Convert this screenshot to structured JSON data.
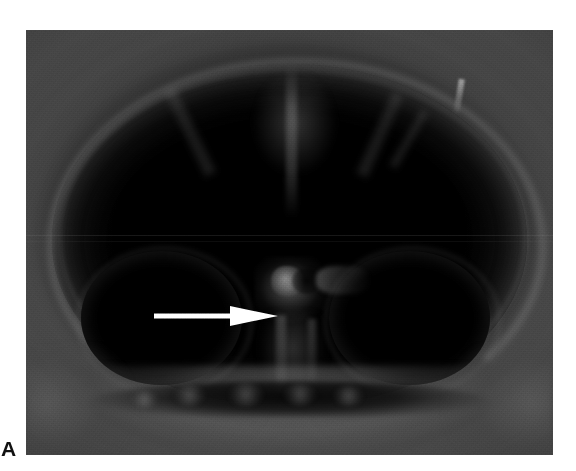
{
  "figure": {
    "panel_label": "A",
    "modality": "axial CT scan of the head",
    "image_type": "grayscale radiographic film photograph",
    "background_color": "#ffffff",
    "film_background_color": "#3c3c3c",
    "annotation_color": "#ffffff",
    "label_color": "#111111"
  },
  "plate": {
    "name": "axial-ct-head-image",
    "left": 26,
    "top": 30,
    "width": 527,
    "height": 425
  },
  "annotations": [
    {
      "type": "arrow",
      "direction": "right",
      "color": "#ffffff",
      "tail_x": 155,
      "tip_x": 252,
      "y": 285,
      "points_at": "midline sellar region"
    }
  ],
  "anatomy": {
    "skull_rim": "bright calvarial bony rim",
    "midline": "interhemispheric falx streak",
    "left_globe": "dark rounded temporal / orbital region (left)",
    "right_globe": "dark rounded temporal / orbital region (right)",
    "sella": "bright midline sellar / pituitary structure",
    "skull_base": "bony facial and skull-base shelf"
  }
}
